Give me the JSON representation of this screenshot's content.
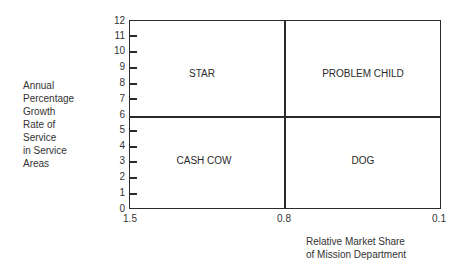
{
  "diagram": {
    "type": "2x2-matrix",
    "y_axis": {
      "label_lines": [
        "Annual",
        "Percentage",
        "Growth",
        "Rate of",
        "Service",
        "in Service",
        "Areas"
      ],
      "ticks": [
        "0",
        "1",
        "2",
        "3",
        "4",
        "5",
        "6",
        "7",
        "8",
        "9",
        "10",
        "11",
        "12"
      ],
      "min": 0,
      "max": 12,
      "divider_at": 6
    },
    "x_axis": {
      "label_lines": [
        "Relative Market Share",
        "of Mission Department"
      ],
      "ticks": [
        "1.5",
        "0.8",
        "0.1"
      ],
      "divider_at": "0.8"
    },
    "quadrants": {
      "top_left": "STAR",
      "top_right": "PROBLEM CHILD",
      "bottom_left": "CASH COW",
      "bottom_right": "DOG"
    }
  }
}
